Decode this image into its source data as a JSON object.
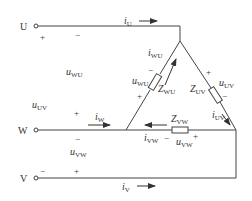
{
  "diagram": {
    "type": "three-phase delta-connected load circuit",
    "line_color": "#444444",
    "terminals": [
      {
        "id": "U",
        "label": "U"
      },
      {
        "id": "W",
        "label": "W"
      },
      {
        "id": "V",
        "label": "V"
      }
    ],
    "line_currents": [
      {
        "id": "iU",
        "sym": "i",
        "sub": "U"
      },
      {
        "id": "iW",
        "sym": "i",
        "sub": "W"
      },
      {
        "id": "iV",
        "sym": "i",
        "sub": "V"
      }
    ],
    "line_voltages": [
      {
        "id": "uWU",
        "sym": "u",
        "sub": "WU",
        "plus_terminal": "U",
        "minus_terminal": "U-right"
      },
      {
        "id": "uUV",
        "sym": "u",
        "sub": "UV"
      },
      {
        "id": "uVW",
        "sym": "u",
        "sub": "VW"
      }
    ],
    "impedances": [
      {
        "id": "ZWU",
        "sym": "Z",
        "sub": "WU"
      },
      {
        "id": "ZUV",
        "sym": "Z",
        "sub": "UV"
      },
      {
        "id": "ZVW",
        "sym": "Z",
        "sub": "VW"
      }
    ],
    "phase_currents": [
      {
        "id": "iWU",
        "sym": "i",
        "sub": "WU"
      },
      {
        "id": "iUV",
        "sym": "i",
        "sub": "UV"
      },
      {
        "id": "iVW",
        "sym": "i",
        "sub": "VW"
      }
    ],
    "phase_voltages": [
      {
        "id": "uWU_phase",
        "sym": "u",
        "sub": "WU"
      },
      {
        "id": "uUV_phase",
        "sym": "u",
        "sub": "UV"
      },
      {
        "id": "uVW_phase",
        "sym": "u",
        "sub": "VW"
      }
    ],
    "signs": {
      "plus": "+",
      "minus": "−"
    }
  }
}
